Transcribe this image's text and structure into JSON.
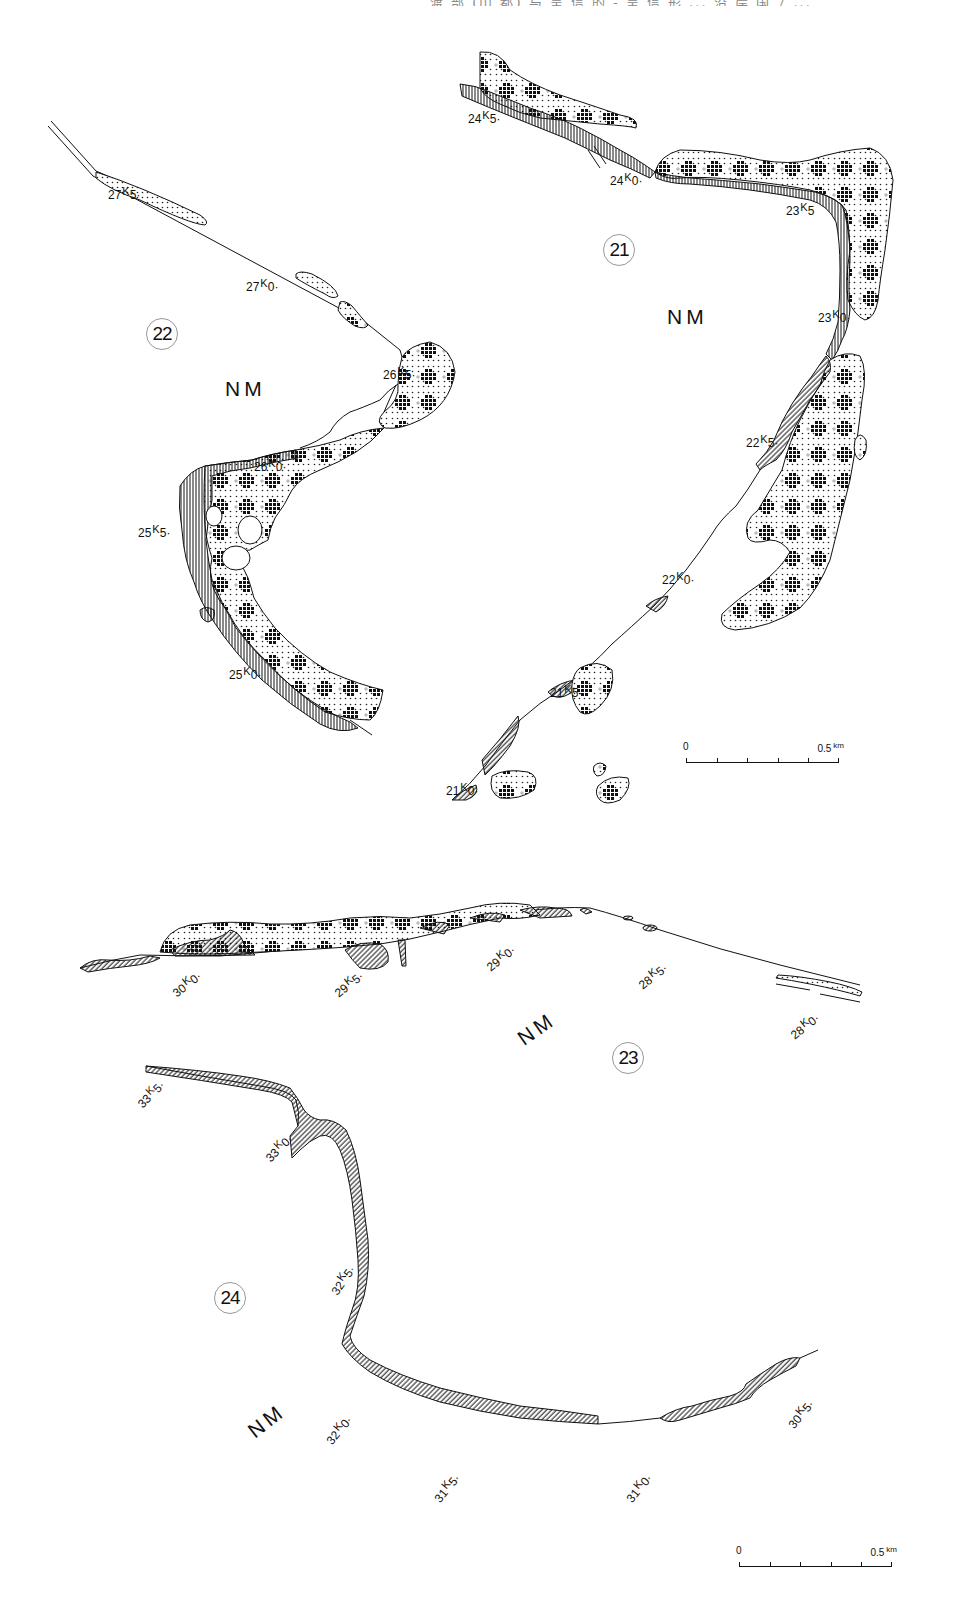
{
  "header": {
    "text": "渡 部 (山 都) 与 呈 信 的 - 呈 信 形 ... 沿 岸 国 7 ..."
  },
  "colors": {
    "ink": "#111111",
    "paper": "#ffffff",
    "circle_border": "#999999"
  },
  "legend_patterns": [
    {
      "name": "hatched-zone",
      "description": "diagonal/vertical hatch"
    },
    {
      "name": "dotted-zone",
      "description": "dot stipple"
    },
    {
      "name": "cross-cluster-zone",
      "description": "dot stipple with cross clusters"
    }
  ],
  "maps": [
    {
      "id": "21",
      "circle_label": "21",
      "region_label": "NM",
      "km_labels": [
        "24K5",
        "24K0",
        "23K5",
        "23K0",
        "22K5",
        "22K0",
        "21K5",
        "21K0"
      ],
      "scale": {
        "start": "0",
        "end": "0.5",
        "unit": "km"
      }
    },
    {
      "id": "22",
      "circle_label": "22",
      "region_label": "NM",
      "km_labels": [
        "27K5",
        "27K0",
        "26K5",
        "26K0",
        "25K5",
        "25K0"
      ]
    },
    {
      "id": "23",
      "circle_label": "23",
      "region_label": "NM",
      "km_labels": [
        "30K0",
        "29K5",
        "29K0",
        "28K5",
        "28K0"
      ]
    },
    {
      "id": "24",
      "circle_label": "24",
      "region_label": "NM",
      "km_labels": [
        "33K5",
        "33K0",
        "32K5",
        "32K0",
        "31K5",
        "31K0",
        "30K5"
      ],
      "scale": {
        "start": "0",
        "end": "0.5",
        "unit": "km"
      }
    }
  ],
  "labels": {
    "m21": {
      "k24_5": {
        "num": "24",
        "sup": "K",
        "tail": "5"
      },
      "k24_0": {
        "num": "24",
        "sup": "K",
        "tail": "0"
      },
      "k23_5": {
        "num": "23",
        "sup": "K",
        "tail": "5"
      },
      "k23_0": {
        "num": "23",
        "sup": "K",
        "tail": "0"
      },
      "k22_5": {
        "num": "22",
        "sup": "K",
        "tail": "5"
      },
      "k22_0": {
        "num": "22",
        "sup": "K",
        "tail": "0"
      },
      "k21_5": {
        "num": "21",
        "sup": "K",
        "tail": "5"
      },
      "k21_0": {
        "num": "21",
        "sup": "K",
        "tail": "0"
      }
    },
    "m22": {
      "k27_5": {
        "num": "27",
        "sup": "K",
        "tail": "5"
      },
      "k27_0": {
        "num": "27",
        "sup": "K",
        "tail": "0"
      },
      "k26_5": {
        "num": "26",
        "sup": "K",
        "tail": "5"
      },
      "k26_0": {
        "num": "26",
        "sup": "K",
        "tail": "0"
      },
      "k25_5": {
        "num": "25",
        "sup": "K",
        "tail": "5"
      },
      "k25_0": {
        "num": "25",
        "sup": "K",
        "tail": "0"
      }
    },
    "m23": {
      "k30_0": {
        "num": "30",
        "sup": "K",
        "tail": "0"
      },
      "k29_5": {
        "num": "29",
        "sup": "K",
        "tail": "5"
      },
      "k29_0": {
        "num": "29",
        "sup": "K",
        "tail": "0"
      },
      "k28_5": {
        "num": "28",
        "sup": "K",
        "tail": "5"
      },
      "k28_0": {
        "num": "28",
        "sup": "K",
        "tail": "0"
      }
    },
    "m24": {
      "k33_5": {
        "num": "33",
        "sup": "K",
        "tail": "5"
      },
      "k33_0": {
        "num": "33",
        "sup": "K",
        "tail": "0"
      },
      "k32_5": {
        "num": "32",
        "sup": "K",
        "tail": "5"
      },
      "k32_0": {
        "num": "32",
        "sup": "K",
        "tail": "0"
      },
      "k31_5": {
        "num": "31",
        "sup": "K",
        "tail": "5"
      },
      "k31_0": {
        "num": "31",
        "sup": "K",
        "tail": "0"
      },
      "k30_5": {
        "num": "30",
        "sup": "K",
        "tail": "5"
      }
    }
  },
  "circles": {
    "c21": "21",
    "c22": "22",
    "c23": "23",
    "c24": "24"
  },
  "region": {
    "nm": "NM"
  },
  "scale_bars": {
    "top": {
      "start": "0",
      "end": "0.5",
      "unit": "km"
    },
    "bottom": {
      "start": "0",
      "end": "0.5",
      "unit": "km"
    }
  }
}
